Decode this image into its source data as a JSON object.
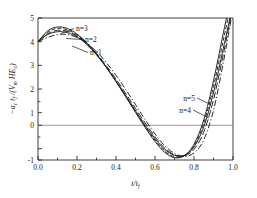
{
  "chart_data": {
    "type": "line",
    "title": "",
    "xlabel": "t/t_f",
    "ylabel": "-a_c t_f / (V_m HE_c)",
    "xlim": [
      0.0,
      1.0
    ],
    "ylim": [
      -1.0,
      5.0
    ],
    "grid": false,
    "legend_position": "inline-annotations",
    "xticks": [
      "0.0",
      "0.2",
      "0.4",
      "0.6",
      "0.8",
      "1.0"
    ],
    "xtick_values": [
      0.0,
      0.2,
      0.4,
      0.6,
      0.8,
      1.0
    ],
    "yticks": [
      "5",
      "4",
      "3",
      "2",
      "1",
      "0",
      "-1"
    ],
    "ytick_values": [
      5,
      4,
      3,
      2,
      1,
      0,
      -1
    ],
    "zero_line": 0,
    "x": [
      0.0,
      0.05,
      0.1,
      0.15,
      0.2,
      0.25,
      0.3,
      0.35,
      0.4,
      0.45,
      0.5,
      0.55,
      0.6,
      0.65,
      0.7,
      0.75,
      0.8,
      0.85,
      0.9,
      0.95,
      1.0
    ],
    "series": [
      {
        "name": "n=1",
        "label": "n=1",
        "style": "solid",
        "values": [
          4.0,
          4.3,
          4.42,
          4.38,
          4.2,
          3.88,
          3.44,
          2.92,
          2.34,
          1.72,
          1.08,
          0.46,
          -0.1,
          -0.55,
          -0.8,
          -0.8,
          -0.45,
          0.4,
          1.85,
          3.7,
          5.6
        ]
      },
      {
        "name": "n=2",
        "label": "n=2",
        "style": "dashed",
        "values": [
          4.0,
          4.4,
          4.56,
          4.5,
          4.28,
          3.93,
          3.47,
          2.93,
          2.33,
          1.7,
          1.05,
          0.42,
          -0.16,
          -0.62,
          -0.86,
          -0.82,
          -0.4,
          0.55,
          2.1,
          4.05,
          6.0
        ]
      },
      {
        "name": "n=3",
        "label": "n=3",
        "style": "solid",
        "values": [
          4.0,
          4.46,
          4.62,
          4.56,
          4.32,
          3.96,
          3.48,
          2.92,
          2.31,
          1.67,
          1.01,
          0.37,
          -0.22,
          -0.68,
          -0.9,
          -0.82,
          -0.33,
          0.7,
          2.35,
          4.35,
          6.3
        ]
      },
      {
        "name": "n=4",
        "label": "n=4",
        "style": "dashdot",
        "values": [
          4.0,
          4.18,
          4.3,
          4.3,
          4.18,
          3.94,
          3.58,
          3.12,
          2.58,
          1.98,
          1.34,
          0.7,
          0.1,
          -0.4,
          -0.72,
          -0.85,
          -0.7,
          -0.15,
          1.1,
          3.1,
          5.4
        ]
      },
      {
        "name": "n=5",
        "label": "n=5",
        "style": "dashed-long",
        "values": [
          4.0,
          4.34,
          4.48,
          4.44,
          4.24,
          3.92,
          3.5,
          2.99,
          2.42,
          1.81,
          1.18,
          0.56,
          -0.02,
          -0.5,
          -0.78,
          -0.83,
          -0.55,
          0.18,
          1.55,
          3.45,
          5.5
        ]
      }
    ],
    "annotations": [
      {
        "text": "n=3",
        "x": 0.175,
        "y": 4.78,
        "anchor": "left"
      },
      {
        "text": "n=2",
        "x": 0.225,
        "y": 4.3,
        "anchor": "left"
      },
      {
        "text": "n=1",
        "x": 0.255,
        "y": 3.72,
        "anchor": "left"
      },
      {
        "text": "n=5",
        "x": 0.745,
        "y": 1.62,
        "anchor": "right"
      },
      {
        "text": "n=4",
        "x": 0.725,
        "y": 1.1,
        "anchor": "right"
      }
    ]
  },
  "axis": {
    "x_title_main": "t",
    "x_title_sep": "/",
    "x_title_num": "t",
    "x_title_sub": "f",
    "y_title": "−a  t  / (V  HE )",
    "y_title_plain": "-a_c t_f /(V_m HE_c)"
  }
}
